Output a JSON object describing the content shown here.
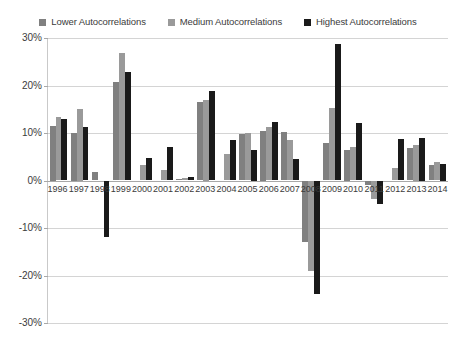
{
  "legend": {
    "position": "top",
    "items": [
      {
        "label": "Lower Autocorrelations",
        "color": "#808080",
        "marker": "square-marker-icon"
      },
      {
        "label": "Medium Autocorrelations",
        "color": "#9a9a9a",
        "marker": "square-marker-icon"
      },
      {
        "label": "Highest Autocorrelations",
        "color": "#1a1a1a",
        "marker": "square-marker-icon"
      }
    ]
  },
  "axis": {
    "y_ticks": [
      "30%",
      "20%",
      "10%",
      "0%",
      "-10%",
      "-20%",
      "-30%"
    ],
    "y_tick_values": [
      30,
      20,
      10,
      0,
      -10,
      -20,
      -30
    ]
  },
  "colors": {
    "lower": "#808080",
    "medium": "#9a9a9a",
    "highest": "#1a1a1a",
    "gridline": "#d4d4d4",
    "axis": "#a8a8a8",
    "text": "#3b3b3b",
    "background": "#ffffff"
  },
  "chart_data": {
    "type": "bar",
    "title": "",
    "subtitle": "",
    "xlabel": "",
    "ylabel": "",
    "ylim": [
      -30,
      30
    ],
    "ytick_step": 10,
    "yunit": "%",
    "grid": true,
    "legend_position": "top",
    "categories": [
      "1996",
      "1997",
      "1998",
      "1999",
      "2000",
      "2001",
      "2002",
      "2003",
      "2004",
      "2005",
      "2006",
      "2007",
      "2008",
      "2009",
      "2010",
      "2011",
      "2012",
      "2013",
      "2014"
    ],
    "series": [
      {
        "name": "Lower Autocorrelations",
        "color": "#808080",
        "values": [
          11.5,
          10.0,
          1.8,
          20.8,
          0.0,
          0.0,
          0.3,
          16.6,
          0.0,
          9.7,
          10.5,
          10.2,
          -13.0,
          7.9,
          6.5,
          -1.0,
          0.0,
          6.8,
          3.3
        ]
      },
      {
        "name": "Medium Autocorrelations",
        "color": "#9a9a9a",
        "values": [
          13.3,
          15.0,
          0.0,
          26.9,
          3.3,
          2.3,
          0.6,
          17.0,
          5.6,
          9.9,
          11.3,
          8.6,
          -19.0,
          15.3,
          7.1,
          -3.8,
          2.6,
          7.5,
          3.9
        ]
      },
      {
        "name": "Highest Autocorrelations",
        "color": "#1a1a1a",
        "values": [
          12.9,
          11.3,
          -11.9,
          22.9,
          4.7,
          7.1,
          0.8,
          18.8,
          8.6,
          6.5,
          12.3,
          4.6,
          -23.8,
          28.7,
          12.2,
          -4.9,
          8.8,
          9.0,
          3.5
        ]
      }
    ]
  }
}
